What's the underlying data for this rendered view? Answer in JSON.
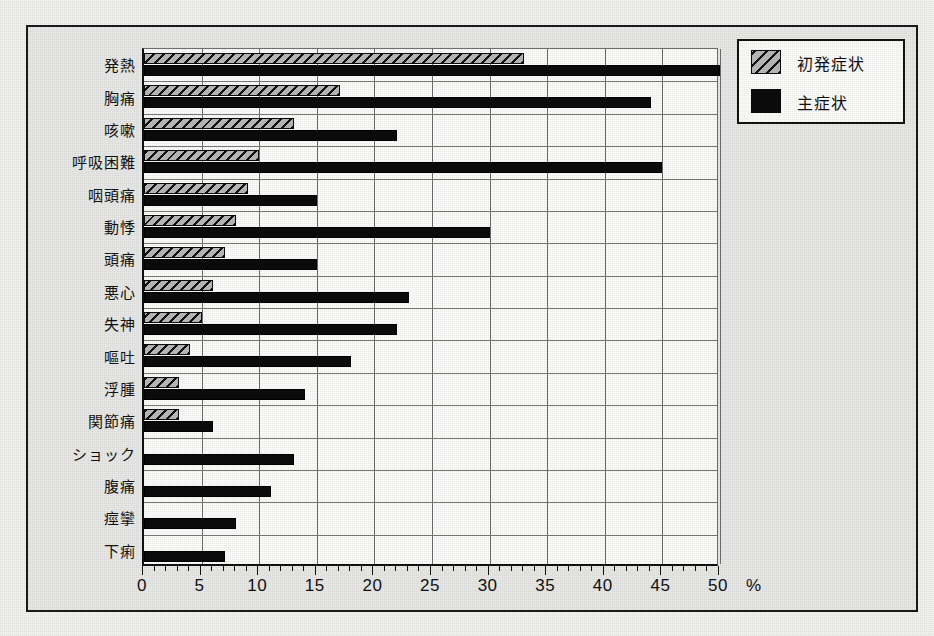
{
  "chart_data": {
    "type": "bar",
    "orientation": "horizontal",
    "title": "",
    "xlabel": "%",
    "ylabel": "",
    "xlim": [
      0,
      50
    ],
    "xticks": [
      0,
      5,
      10,
      15,
      20,
      25,
      30,
      35,
      40,
      45,
      50
    ],
    "xtick_labels": [
      "0",
      "5",
      "10",
      "15",
      "20",
      "25",
      "30",
      "35",
      "40",
      "45",
      "50"
    ],
    "minor_tick_step": 1,
    "grid": "vertical-and-horizontal",
    "legend_position": "top-right",
    "categories": [
      "発熱",
      "胸痛",
      "咳嗽",
      "呼吸困難",
      "咽頭痛",
      "動悸",
      "頭痛",
      "悪心",
      "失神",
      "嘔吐",
      "浮腫",
      "関節痛",
      "ショック",
      "腹痛",
      "痙攣",
      "下痢"
    ],
    "series": [
      {
        "name": "初発症状",
        "pattern": "diagonal-hatch",
        "color": "#b4b4b4",
        "values": [
          33,
          17,
          13,
          10,
          9,
          8,
          7,
          6,
          5,
          4,
          3,
          3,
          0,
          0,
          0,
          0
        ]
      },
      {
        "name": "主症状",
        "pattern": "solid",
        "color": "#0b0b0b",
        "values": [
          50,
          44,
          22,
          45,
          15,
          30,
          15,
          23,
          22,
          18,
          14,
          6,
          13,
          11,
          8,
          7
        ]
      }
    ]
  },
  "legend": {
    "items": [
      {
        "label": "初発症状",
        "swatch": "hatched-swatch"
      },
      {
        "label": "主症状",
        "swatch": "black-swatch"
      }
    ]
  },
  "axis": {
    "unit_label": "%"
  },
  "colors": {
    "background": "#e9e9e7",
    "plot_background": "#fdfdfb",
    "frame": "#131313",
    "grid": "#6e6e6e",
    "bar_main": "#0b0b0b",
    "bar_first": "#b4b4b4"
  }
}
